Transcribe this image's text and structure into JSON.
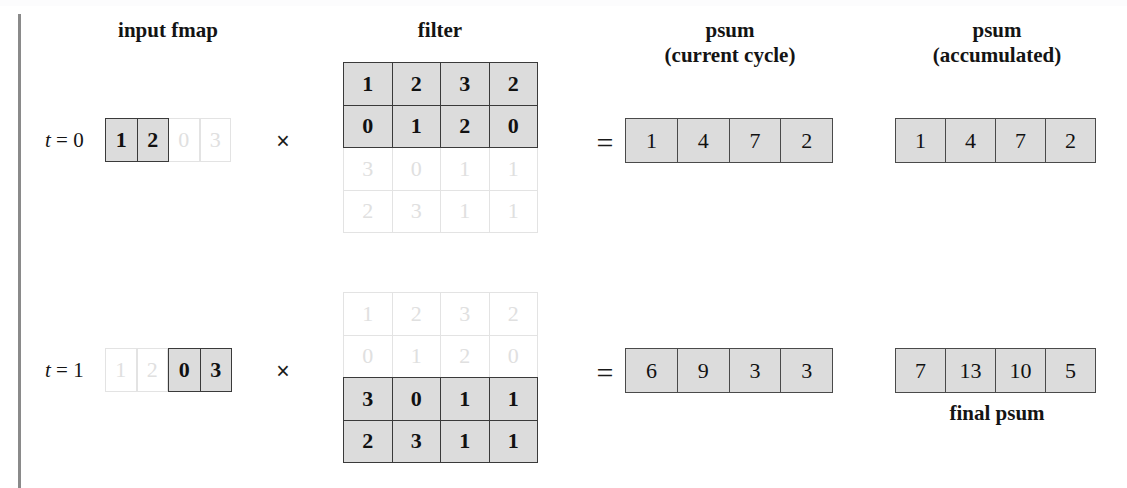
{
  "figure": {
    "headers": {
      "input_fmap": "input fmap",
      "filter": "filter",
      "psum_current_line1": "psum",
      "psum_current_line2": "(current cycle)",
      "psum_accum_line1": "psum",
      "psum_accum_line2": "(accumulated)"
    },
    "operators": {
      "multiply": "×",
      "equals": "="
    },
    "footer_label": "final psum",
    "colors": {
      "active_fill": "#dcdcdc",
      "active_border": "#3a3a3a",
      "inactive_border": "#e3e3e3",
      "inactive_text": "#e0e0e0",
      "text": "#111111",
      "rule": "#8a8a8a"
    },
    "rows": [
      {
        "step_label": "t = 0",
        "step_var": "t",
        "step_eq": "=",
        "step_value": "0",
        "input_fmap": {
          "values": [
            "1",
            "2",
            "0",
            "3"
          ],
          "active": [
            true,
            true,
            false,
            false
          ]
        },
        "filter": {
          "rows": [
            {
              "values": [
                "1",
                "2",
                "3",
                "2"
              ],
              "active": true
            },
            {
              "values": [
                "0",
                "1",
                "2",
                "0"
              ],
              "active": true
            },
            {
              "values": [
                "3",
                "0",
                "1",
                "1"
              ],
              "active": false
            },
            {
              "values": [
                "2",
                "3",
                "1",
                "1"
              ],
              "active": false
            }
          ]
        },
        "psum_current": [
          "1",
          "4",
          "7",
          "2"
        ],
        "psum_accumulated": [
          "1",
          "4",
          "7",
          "2"
        ]
      },
      {
        "step_label": "t = 1",
        "step_var": "t",
        "step_eq": "=",
        "step_value": "1",
        "input_fmap": {
          "values": [
            "1",
            "2",
            "0",
            "3"
          ],
          "active": [
            false,
            false,
            true,
            true
          ]
        },
        "filter": {
          "rows": [
            {
              "values": [
                "1",
                "2",
                "3",
                "2"
              ],
              "active": false
            },
            {
              "values": [
                "0",
                "1",
                "2",
                "0"
              ],
              "active": false
            },
            {
              "values": [
                "3",
                "0",
                "1",
                "1"
              ],
              "active": true
            },
            {
              "values": [
                "2",
                "3",
                "1",
                "1"
              ],
              "active": true
            }
          ]
        },
        "psum_current": [
          "6",
          "9",
          "3",
          "3"
        ],
        "psum_accumulated": [
          "7",
          "13",
          "10",
          "5"
        ]
      }
    ]
  },
  "chart_data": {
    "type": "table",
    "columns": [
      "input fmap",
      "filter",
      "psum (current cycle)",
      "psum (accumulated)"
    ],
    "steps": [
      {
        "t": 0,
        "input_fmap": [
          1,
          2,
          0,
          3
        ],
        "input_fmap_active_indices": [
          0,
          1
        ],
        "filter_matrix": [
          [
            1,
            2,
            3,
            2
          ],
          [
            0,
            1,
            2,
            0
          ],
          [
            3,
            0,
            1,
            1
          ],
          [
            2,
            3,
            1,
            1
          ]
        ],
        "filter_active_rows": [
          0,
          1
        ],
        "psum_current": [
          1,
          4,
          7,
          2
        ],
        "psum_accumulated": [
          1,
          4,
          7,
          2
        ]
      },
      {
        "t": 1,
        "input_fmap": [
          1,
          2,
          0,
          3
        ],
        "input_fmap_active_indices": [
          2,
          3
        ],
        "filter_matrix": [
          [
            1,
            2,
            3,
            2
          ],
          [
            0,
            1,
            2,
            0
          ],
          [
            3,
            0,
            1,
            1
          ],
          [
            2,
            3,
            1,
            1
          ]
        ],
        "filter_active_rows": [
          2,
          3
        ],
        "psum_current": [
          6,
          9,
          3,
          3
        ],
        "psum_accumulated": [
          7,
          13,
          10,
          5
        ]
      }
    ],
    "annotations": [
      "final psum"
    ]
  },
  "geometry": {
    "fmap": {
      "x": 105,
      "w": 31.5,
      "h": 44
    },
    "filter": {
      "x": 343,
      "cw": 48.5,
      "ch": 42.5
    },
    "psum_cur": {
      "x": 625,
      "w": 51.8,
      "h": 45
    },
    "psum_acc": {
      "x": 895,
      "w": 50,
      "h": 45
    },
    "row_y": {
      "fmap": [
        118,
        348
      ],
      "filter": [
        62,
        292
      ],
      "psum": [
        118,
        348
      ]
    },
    "label_x": 45,
    "mult_x": 268,
    "eq_x": 590
  }
}
